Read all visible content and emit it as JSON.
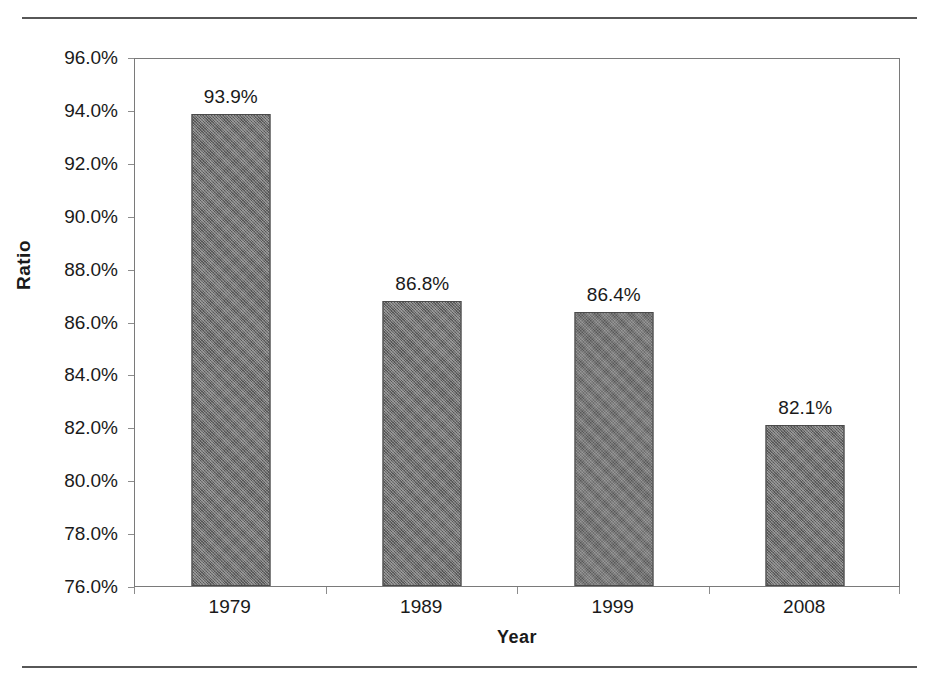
{
  "page": {
    "top_rule": "horizontal-rule",
    "bottom_rule": "horizontal-rule",
    "clipped_header_text": ""
  },
  "chart_data": {
    "type": "bar",
    "title": "",
    "subtitle": "",
    "xlabel": "Year",
    "ylabel": "Ratio",
    "categories": [
      "1979",
      "1989",
      "1999",
      "2008"
    ],
    "values": [
      93.9,
      86.8,
      86.4,
      82.1
    ],
    "value_labels": [
      "93.9%",
      "86.8%",
      "86.4%",
      "82.1%"
    ],
    "ylim": [
      76.0,
      96.0
    ],
    "ytick_step": 2.0,
    "ytick_labels": [
      "96.0%",
      "94.0%",
      "92.0%",
      "90.0%",
      "88.0%",
      "86.0%",
      "84.0%",
      "82.0%",
      "80.0%",
      "78.0%",
      "76.0%"
    ],
    "ytick_values": [
      96.0,
      94.0,
      92.0,
      90.0,
      88.0,
      86.0,
      84.0,
      82.0,
      80.0,
      78.0,
      76.0
    ],
    "grid": false,
    "legend": false,
    "legend_position": "none",
    "series": [
      {
        "name": "Ratio",
        "values": [
          93.9,
          86.8,
          86.4,
          82.1
        ],
        "color": "#6e6e6e"
      }
    ],
    "bar_fill_color": "#6e6e6e",
    "bar_border_color": "#4a4a4a",
    "axis_color": "#7a7a7a",
    "text_color": "#1a1a1a"
  }
}
